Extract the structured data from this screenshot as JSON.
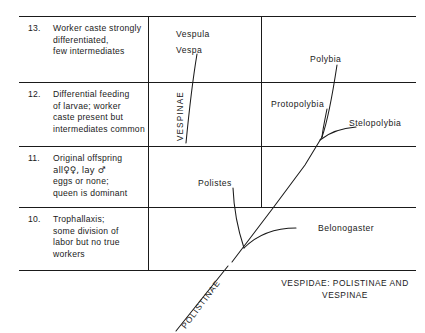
{
  "figure": {
    "caption": {
      "line1": "VESPIDAE: POLISTINAE AND",
      "line2": "VESPINAE"
    },
    "subfamily_labels": {
      "vespinae": "VESPINAE",
      "polistinae": "POLISTINAE"
    }
  },
  "rows": [
    {
      "number": "13.",
      "lines": [
        "Worker caste strongly",
        "differentiated,",
        "few intermediates"
      ]
    },
    {
      "number": "12.",
      "lines": [
        "Differential feeding",
        "of larvae; worker",
        "caste present but",
        "intermediates common"
      ]
    },
    {
      "number": "11.",
      "lines": [
        "Original offspring",
        "all♀♀, lay ♂",
        "eggs or none;",
        "queen is dominant"
      ]
    },
    {
      "number": "10.",
      "lines": [
        "Trophallaxis;",
        "some division of",
        "labor but no true",
        "workers"
      ]
    }
  ],
  "taxa": [
    {
      "name": "Vespula"
    },
    {
      "name": "Vespa"
    },
    {
      "name": "Polybia"
    },
    {
      "name": "Protopolybia"
    },
    {
      "name": "Stelopolybia"
    },
    {
      "name": "Polistes"
    },
    {
      "name": "Belonogaster"
    }
  ],
  "colors": {
    "ink": "#1a1a1a",
    "rule": "#1a1a1a",
    "background": "#ffffff"
  }
}
